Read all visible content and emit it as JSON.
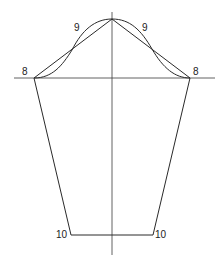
{
  "diagram": {
    "type": "sleeve-pattern-draft",
    "labels": {
      "underarm_left": "8",
      "underarm_right": "8",
      "cap_left": "9",
      "cap_right": "9",
      "wrist_left": "10",
      "wrist_right": "10"
    },
    "points": {
      "apex": [
        112,
        19
      ],
      "underarm_left": [
        34,
        78
      ],
      "underarm_right": [
        190,
        78
      ],
      "wrist_left": [
        71,
        235
      ],
      "wrist_right": [
        153,
        235
      ],
      "cap_cross_left": [
        72,
        50
      ],
      "cap_cross_right": [
        152,
        49
      ]
    },
    "axes": {
      "vertical": {
        "x": 112,
        "y1": 12,
        "y2": 255
      },
      "horizontal": {
        "y": 78,
        "x1": 14,
        "x2": 215
      }
    },
    "colors": {
      "line": "#2a2a2a",
      "background": "#ffffff"
    }
  }
}
